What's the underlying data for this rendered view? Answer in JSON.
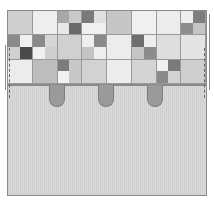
{
  "diagram": {
    "title": "",
    "colors": {
      "white": "#f2f2f2",
      "light": "#dcdcdc",
      "mid": "#bdbdbd",
      "dark": "#8c8c8c",
      "darker": "#5e5e5e",
      "tab": "#9a9a9a",
      "body": "#d4d4d4",
      "outline": "#8a8a8a"
    },
    "grid": {
      "columns": 8,
      "rows": 3,
      "cells": [
        [
          {
            "fill": "#cfcfcf"
          },
          {
            "fill": "#eeeeee"
          },
          {
            "split": [
              "#a8a8a8",
              "#c9c9c9",
              "#e8e8e8",
              "#6a6a6a"
            ]
          },
          {
            "split": [
              "#7a7a7a",
              "#e0e0e0",
              "#f0f0f0",
              "#f0f0f0"
            ]
          },
          {
            "fill": "#c6c6c6"
          },
          {
            "fill": "#f0f0f0"
          },
          {
            "fill": "#ececec"
          },
          {
            "split": [
              "#eeeeee",
              "#7e7e7e",
              "#8e8e8e",
              "#c4c4c4"
            ]
          }
        ],
        [
          {
            "split": [
              "#8a8a8a",
              "#f0f0f0",
              "#d0d0d0",
              "#4a4a4a"
            ]
          },
          {
            "split": [
              "#8a8a8a",
              "#d6d6d6",
              "#f0f0f0",
              "#cfcfcf"
            ]
          },
          {
            "fill": "#d0d0d0"
          },
          {
            "split": [
              "#eeeeee",
              "#8a8a8a",
              "#c4c4c4",
              "#eeeeee"
            ]
          },
          {
            "fill": "#ececec"
          },
          {
            "split": [
              "#6e6e6e",
              "#eeeeee",
              "#c6c6c6",
              "#8c8c8c"
            ]
          },
          {
            "fill": "#dedede"
          },
          {
            "fill": "#e4e4e4"
          }
        ],
        [
          {
            "fill": "#ececec"
          },
          {
            "fill": "#bdbdbd"
          },
          {
            "split": [
              "#7c7c7c",
              "#c8c8c8",
              "#f2f2f2",
              "#c8c8c8"
            ]
          },
          {
            "fill": "#d2d2d2"
          },
          {
            "fill": "#ededed"
          },
          {
            "fill": "#d4d4d4"
          },
          {
            "split": [
              "#f0f0f0",
              "#7a7a7a",
              "#8a8a8a",
              "#d2d2d2"
            ]
          },
          {
            "fill": "#cfcfcf"
          }
        ]
      ]
    },
    "tabs": [
      {
        "x": 49,
        "label": "tab-1"
      },
      {
        "x": 98,
        "label": "tab-2"
      },
      {
        "x": 147,
        "label": "tab-3"
      }
    ],
    "fold_lines": [
      {
        "side": "left",
        "x": 2
      },
      {
        "side": "right",
        "x": 197
      }
    ]
  }
}
